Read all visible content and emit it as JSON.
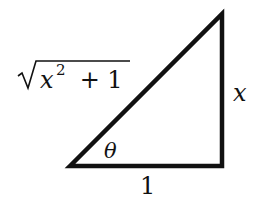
{
  "diagram": {
    "type": "right-triangle",
    "stroke_color": "#111111",
    "background_color": "#ffffff",
    "vertices": {
      "top": [
        222,
        14
      ],
      "bottom_left": [
        70,
        166
      ],
      "bottom_right": [
        222,
        166
      ]
    },
    "labels": {
      "hypotenuse": {
        "radical_symbol": "√",
        "variable": "x",
        "exponent": "2",
        "rest": " + 1",
        "full_text": "√(x² + 1)"
      },
      "opposite": "x",
      "adjacent": "1",
      "angle": "θ"
    }
  }
}
